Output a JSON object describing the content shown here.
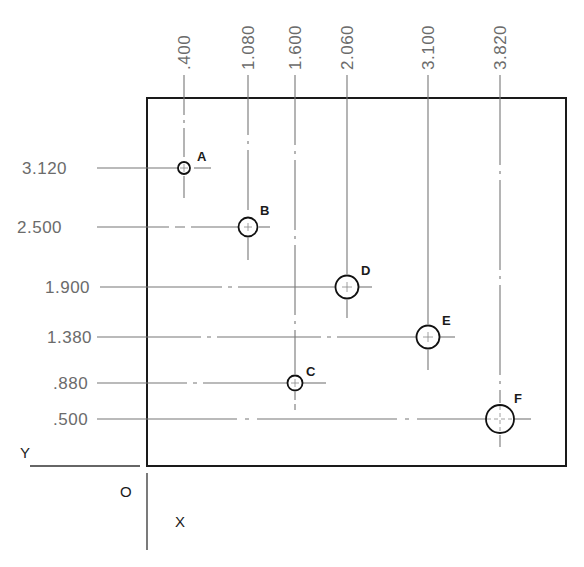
{
  "drawing": {
    "type": "rectangular coordinate hole location drawing",
    "plate": {
      "left": 147,
      "top": 98,
      "right": 566,
      "bottom": 466
    },
    "line_color": "#1a1a1a",
    "leader_color": "#777777",
    "text_color": "#6b6b6b",
    "x_dimensions": [
      ".400",
      "1.080",
      "1.600",
      "2.060",
      "3.100",
      "3.820"
    ],
    "y_dimensions": [
      "3.120",
      "2.500",
      "1.900",
      "1.380",
      ".880",
      ".500"
    ],
    "axes": {
      "y_label": "Y",
      "x_label": "X",
      "origin_label": "O"
    },
    "holes": [
      {
        "label": "A",
        "x": ".400",
        "y": "3.120",
        "px": 184,
        "py": 168,
        "r": 6
      },
      {
        "label": "B",
        "x": "1.080",
        "y": "2.500",
        "px": 248,
        "py": 227,
        "r": 9
      },
      {
        "label": "C",
        "x": "1.600",
        "y": ".880",
        "px": 295,
        "py": 383,
        "r": 7
      },
      {
        "label": "D",
        "x": "2.060",
        "y": "1.900",
        "px": 347,
        "py": 287,
        "r": 11
      },
      {
        "label": "E",
        "x": "3.100",
        "y": "1.380",
        "px": 428,
        "py": 337,
        "r": 11
      },
      {
        "label": "F",
        "x": "3.820",
        "y": ".500",
        "px": 500,
        "py": 419,
        "r": 14
      }
    ]
  }
}
